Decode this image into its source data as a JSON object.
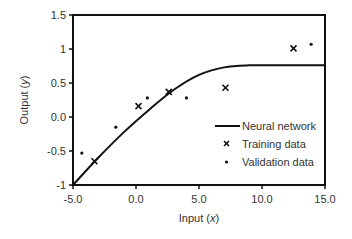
{
  "chart_data": {
    "type": "scatter",
    "title": "",
    "xlabel": "Input (x)",
    "xlabel_main": "Input (",
    "xlabel_var": "x",
    "xlabel_end": ")",
    "ylabel": "Output (y)",
    "ylabel_main": "Output (",
    "ylabel_var": "y",
    "ylabel_end": ")",
    "xlim": [
      -5.0,
      15.0
    ],
    "ylim": [
      -1,
      1.5
    ],
    "x_ticks": [
      -5.0,
      0.0,
      5.0,
      10.0,
      15.0
    ],
    "x_tick_labels": [
      "-5.0",
      "0.0",
      "5.0",
      "10.0",
      "15.0"
    ],
    "y_ticks": [
      -1,
      -0.5,
      0.0,
      0.5,
      1,
      1.5
    ],
    "y_tick_labels": [
      "-1",
      "-0.5",
      "0.0",
      "0.5",
      "1",
      "1.5"
    ],
    "grid": false,
    "legend_position": "lower right",
    "series": [
      {
        "name": "Neural network",
        "type": "line",
        "x": [
          -5.0,
          -3.0,
          -1.0,
          1.0,
          3.0,
          5.0,
          7.0,
          9.0,
          11.0,
          13.0,
          15.0
        ],
        "y": [
          -1.0,
          -0.6,
          -0.23,
          0.1,
          0.4,
          0.62,
          0.73,
          0.76,
          0.76,
          0.76,
          0.76
        ]
      },
      {
        "name": "Training data",
        "type": "scatter",
        "marker": "x",
        "x": [
          -3.3,
          0.2,
          2.6,
          7.1,
          12.5
        ],
        "y": [
          -0.65,
          0.16,
          0.37,
          0.43,
          1.01
        ]
      },
      {
        "name": "Validation data",
        "type": "scatter",
        "marker": "dot",
        "x": [
          -4.3,
          -1.6,
          0.9,
          4.0,
          13.9
        ],
        "y": [
          -0.53,
          -0.15,
          0.28,
          0.28,
          1.07
        ]
      }
    ]
  },
  "legend": {
    "items": [
      "Neural network",
      "Training data",
      "Validation data"
    ]
  },
  "colors": {
    "line": "#111111",
    "axis": "#111111",
    "text": "#333333"
  }
}
